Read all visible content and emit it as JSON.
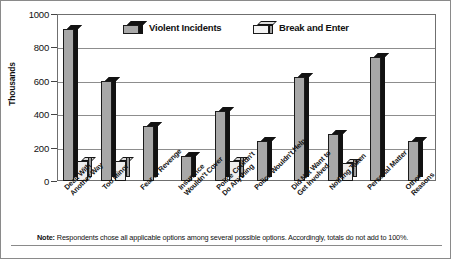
{
  "chart_data": {
    "type": "bar",
    "title": "",
    "xlabel": "",
    "ylabel": "Thousands",
    "ylim": [
      0,
      1000
    ],
    "yticks": [
      0,
      200,
      400,
      600,
      800,
      1000
    ],
    "grid": true,
    "legend_position": "top-inside",
    "categories": [
      "Dealt With Another Way",
      "Too Minor",
      "Fear of Revenge",
      "Insurance Wouldn't Cover",
      "Police Couldn't Do Anything",
      "Police Wouldn't Help",
      "Did Not Want to Get Involved",
      "Nothing Taken",
      "Personal Matter",
      "Other Reasons"
    ],
    "series": [
      {
        "name": "Violent Incidents",
        "color": "#a8a8a8",
        "values": [
          910,
          600,
          330,
          150,
          420,
          240,
          620,
          280,
          740,
          240
        ]
      },
      {
        "name": "Break and Enter",
        "color": "#eeeeee",
        "values": [
          120,
          120,
          null,
          null,
          120,
          null,
          null,
          110,
          null,
          null
        ]
      }
    ],
    "annotations": [
      "Note: Respondents chose all applicable options among several possible options. Accordingly, totals do not add to 100%."
    ]
  },
  "axis": {
    "y_label": "Thousands",
    "y_ticks": [
      "1000",
      "800",
      "600",
      "400",
      "200",
      "0"
    ]
  },
  "legend": {
    "items": [
      {
        "label": "Violent Incidents",
        "icon": "bar-swatch-gray-icon"
      },
      {
        "label": "Break and Enter",
        "icon": "bar-swatch-white-icon"
      }
    ]
  },
  "x_labels": [
    "Dealt With\nAnother Way",
    "Too Minor",
    "Fear of Revenge",
    "Insurance\nWouldn't Cover",
    "Police Couldn't\nDo Anything",
    "Police Wouldn't Help",
    "Did Not Want to\nGet Involved",
    "Nothing Taken",
    "Personal Matter",
    "Other Reasons"
  ],
  "note": {
    "prefix": "Note:",
    "text": " Respondents chose all applicable options among several possible options. Accordingly, totals do not add to 100%."
  }
}
